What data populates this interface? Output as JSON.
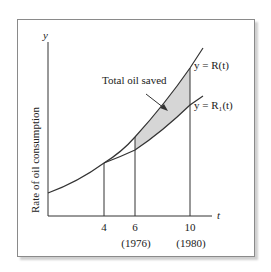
{
  "figure": {
    "y_axis_symbol": "y",
    "x_axis_symbol": "t",
    "y_axis_label": "Rate of oil consumption",
    "annotation": "Total oil saved",
    "curve_labels": {
      "upper": "y = R(t)",
      "lower": "y = R₁(t)"
    },
    "ticks": [
      {
        "value": "4",
        "year": ""
      },
      {
        "value": "6",
        "year": "(1976)"
      },
      {
        "value": "10",
        "year": "(1980)"
      }
    ],
    "colors": {
      "line": "#333333",
      "shade": "#d6d6d6",
      "frame": "#8a8a8a"
    }
  }
}
